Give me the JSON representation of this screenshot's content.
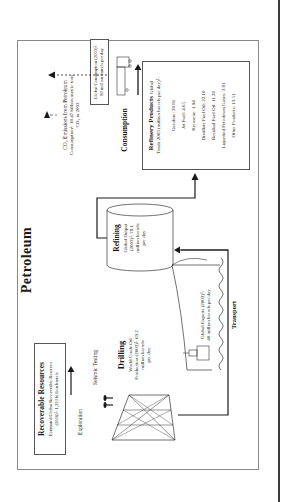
{
  "title": "Petroleum",
  "recoverable": {
    "heading": "Recoverable Resources",
    "line1": "Estimated Global Recoverable Reserves",
    "line2": "(2006)²: 1,293 billion barrels"
  },
  "exploration": {
    "label": "Exploration"
  },
  "seismic": {
    "label": "Seismic Testing"
  },
  "drilling": {
    "heading": "Drilling",
    "line1": "World Crude Oil",
    "line2": "Production (2003)²: 69.2",
    "line3": "million barrels",
    "line4": "per day"
  },
  "transport": {
    "label": "Transport",
    "line1": "Global Exports (2003)²:",
    "line2": "40 million barrels per day"
  },
  "refining": {
    "heading": "Refining",
    "line1": "Global Output",
    "line2": "(2003)²: 78.1",
    "line3": "million barrels",
    "line4": "per day"
  },
  "products": {
    "heading": "Refinery Products",
    "heading_suffix": "Global",
    "subheading": "Totals 2003 (million barrels per day)²:",
    "items": [
      "Gasoline: 20.81",
      "Jet Fuel: 4.65",
      "Kerosene: 1.94",
      "Distillate Fuel Oil: 22.10",
      "Residual Fuel Oil: 11.26",
      "Liquefied Petroleum Gases: 3.81",
      "Other Products: 13.51"
    ]
  },
  "consumption": {
    "label": "Consumption",
    "line1": "Global Consumption (2003)²:",
    "line2": "80 million barrels per day"
  },
  "co2": {
    "line1": "CO₂ Emissions from Petroleum",
    "line2": "Consumption³: 10.47 billion metric tons",
    "line3": "CO₂ in 2003"
  },
  "colors": {
    "ink": "#1a1a1a",
    "frame": "#8a8a8a",
    "page_rule": "#3a3a3a"
  }
}
